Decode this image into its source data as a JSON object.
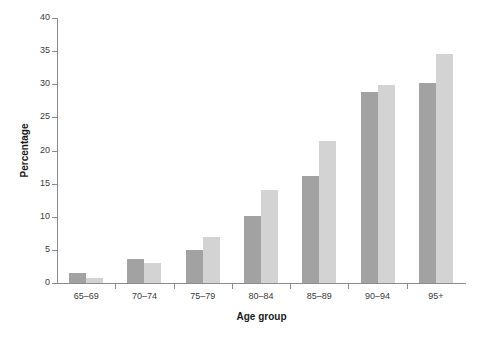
{
  "chart_data": {
    "type": "bar",
    "title": "",
    "subtitle": "",
    "xlabel": "Age group",
    "ylabel": "Percentage",
    "categories": [
      "65–69",
      "70–74",
      "75–79",
      "80–84",
      "85–89",
      "90–94",
      "95+"
    ],
    "series": [
      {
        "name": "series-1",
        "color": "#a2a2a2",
        "values": [
          1.5,
          3.7,
          5.0,
          10.1,
          16.1,
          28.8,
          30.2
        ]
      },
      {
        "name": "series-2",
        "color": "#d3d3d3",
        "values": [
          0.8,
          3.0,
          6.9,
          14.0,
          21.4,
          29.9,
          34.6
        ]
      }
    ],
    "ylim": [
      0,
      40
    ],
    "ytick_values": [
      0,
      5,
      10,
      15,
      20,
      25,
      30,
      35,
      40
    ],
    "ytick_labels": [
      "0",
      "5",
      "10",
      "15",
      "20",
      "25",
      "30",
      "35",
      "40"
    ],
    "grid": false,
    "legend": null,
    "legend_position": "none",
    "annotations": [],
    "background_color": "#ffffff",
    "axis_color": "#8c8c8c"
  }
}
